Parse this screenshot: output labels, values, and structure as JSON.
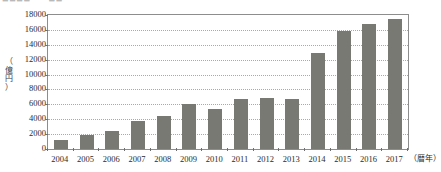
{
  "figure": {
    "cropped_top_caption": "■■■■  —  ■■"
  },
  "axes": {
    "y_unit_label": "（億円）",
    "y_unit_chars": [
      "（",
      "億",
      "円",
      "）"
    ],
    "x_unit_label": "（暦年）"
  },
  "chart_data": {
    "type": "bar",
    "title": "",
    "subtitle": "",
    "xlabel": "（暦年）",
    "ylabel": "（億円）",
    "categories": [
      "2004",
      "2005",
      "2006",
      "2007",
      "2008",
      "2009",
      "2010",
      "2011",
      "2012",
      "2013",
      "2014",
      "2015",
      "2016",
      "2017"
    ],
    "values": [
      1200,
      1900,
      2400,
      3700,
      4500,
      6000,
      5400,
      6700,
      6800,
      6700,
      12900,
      15800,
      16800,
      17400
    ],
    "series": [
      {
        "name": "",
        "values": [
          1200,
          1900,
          2400,
          3700,
          4500,
          6000,
          5400,
          6700,
          6800,
          6700,
          12900,
          15800,
          16800,
          17400
        ]
      }
    ],
    "ylim": [
      0,
      18000
    ],
    "ytick_values": [
      0,
      2000,
      4000,
      6000,
      8000,
      10000,
      12000,
      14000,
      16000,
      18000
    ],
    "ytick_labels": [
      "0",
      "2000",
      "4000",
      "6000",
      "8000",
      "10000",
      "12000",
      "14000",
      "16000",
      "18000"
    ],
    "grid": true,
    "grid_axis": "y",
    "grid_style": "dotted",
    "legend": false,
    "legend_position": "none",
    "bar_color": "#797974",
    "grid_color": "#a9a9a9",
    "frame_color": "#8d8d8d",
    "text_color": "#2b2b2b",
    "background": "#ffffff"
  }
}
